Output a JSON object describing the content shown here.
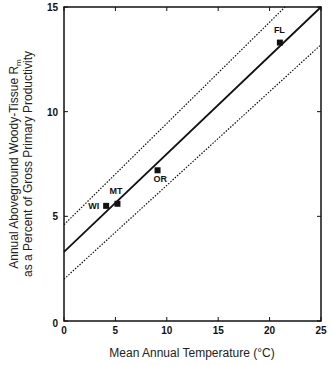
{
  "chart_data": {
    "type": "scatter",
    "title": "",
    "xlabel": "Mean Annual Temperature (°C)",
    "ylabel_line1": "Annual Aboveground Woody-Tissue R",
    "ylabel_subscript": "m",
    "ylabel_line2": "as a Percent of Gross Primary Productivity",
    "xlim": [
      0,
      25
    ],
    "ylim": [
      0,
      15
    ],
    "x_ticks": [
      0,
      5,
      10,
      15,
      20,
      25
    ],
    "y_ticks": [
      0,
      5,
      10,
      15
    ],
    "grid": false,
    "legend": null,
    "points": [
      {
        "label": "WI",
        "x": 4.1,
        "y": 5.5
      },
      {
        "label": "MT",
        "x": 5.2,
        "y": 5.6
      },
      {
        "label": "OR",
        "x": 9.1,
        "y": 7.2
      },
      {
        "label": "FL",
        "x": 21.0,
        "y": 13.3
      }
    ],
    "series": [
      {
        "name": "regression",
        "style": "solid",
        "x": [
          0,
          25
        ],
        "y": [
          3.3,
          15.0
        ]
      },
      {
        "name": "upper confidence bound",
        "style": "dotted",
        "x": [
          0,
          21.5
        ],
        "y": [
          4.6,
          15.0
        ]
      },
      {
        "name": "lower confidence bound",
        "style": "dotted",
        "x": [
          0,
          25
        ],
        "y": [
          2.0,
          13.2
        ]
      }
    ]
  },
  "colors": {
    "line": "#111111",
    "background": "#ffffff"
  }
}
